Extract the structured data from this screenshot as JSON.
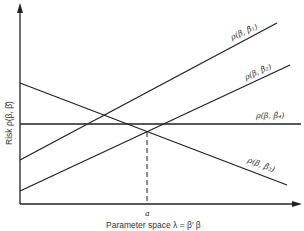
{
  "diagram": {
    "y_axis_label": "Risk  ρ(β, β̂)",
    "x_axis_label": "Parameter space  λ = β′ β",
    "x_marker_label": "a",
    "lines": [
      {
        "id": "beta1",
        "label": "ρ(β, β̂₁)",
        "description": "increasing risk line, highest"
      },
      {
        "id": "beta2",
        "label": "ρ(β, β̂₂)",
        "description": "increasing risk line, lower"
      },
      {
        "id": "beta3",
        "label": "ρ(β, β̂₃)",
        "description": "decreasing risk line"
      },
      {
        "id": "beta4",
        "label": "ρ(β, β̂₄)",
        "description": "constant (horizontal) risk line"
      }
    ],
    "colors": {
      "line": "#222222",
      "background": "#ffffff"
    }
  }
}
